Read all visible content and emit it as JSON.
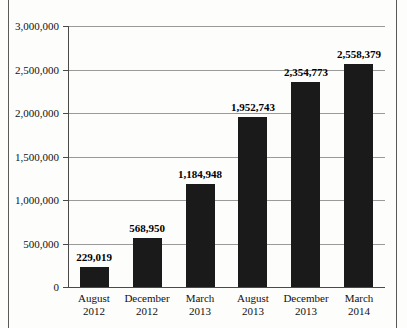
{
  "chart_data": {
    "type": "bar",
    "title": "",
    "subtitle": "",
    "xlabel": "",
    "ylabel": "",
    "categories": [
      {
        "month": "August",
        "year": "2012"
      },
      {
        "month": "December",
        "year": "2012"
      },
      {
        "month": "March",
        "year": "2013"
      },
      {
        "month": "August",
        "year": "2013"
      },
      {
        "month": "December",
        "year": "2013"
      },
      {
        "month": "March",
        "year": "2014"
      }
    ],
    "values": [
      229019,
      568950,
      1184948,
      1952743,
      2354773,
      2558379
    ],
    "value_labels": [
      "229,019",
      "568,950",
      "1,184,948",
      "1,952,743",
      "2,354,773",
      "2,558,379"
    ],
    "ylim": [
      0,
      3000000
    ],
    "yticks": [
      0,
      500000,
      1000000,
      1500000,
      2000000,
      2500000,
      3000000
    ],
    "ytick_labels": [
      "0",
      "500,000",
      "1,000,000",
      "1,500,000",
      "2,000,000",
      "2,500,000",
      "3,000,000"
    ],
    "grid": true,
    "grid_axis": "y",
    "legend": false,
    "legend_position": "none",
    "bar_color": "#1a1a1a",
    "grid_color": "#9a9a9a",
    "axis_color": "#4a4a4a",
    "background_color": "#fdfdfc",
    "text_color": "#111111"
  }
}
